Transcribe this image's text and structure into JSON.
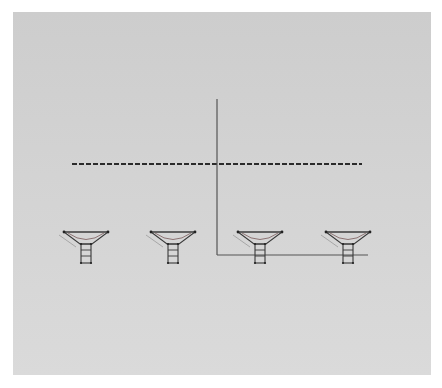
{
  "diagram": {
    "type": "interferometer-array",
    "background": {
      "panel_color": "#d2d2d2",
      "page_color": "#ffffff"
    },
    "wavefront": {
      "style": "dashed",
      "color": "#2a2a2a",
      "y": 164,
      "x_start": 72,
      "x_end": 362
    },
    "axes": {
      "color": "#555555",
      "origin": {
        "x": 217,
        "y": 255
      },
      "vertical_top_y": 99,
      "horizontal_end_x": 368
    },
    "antennas": [
      {
        "id": "antenna-1",
        "center_x": 86
      },
      {
        "id": "antenna-2",
        "center_x": 173
      },
      {
        "id": "antenna-3",
        "center_x": 260
      },
      {
        "id": "antenna-4",
        "center_x": 348
      }
    ],
    "antenna_style": {
      "rim_y": 232,
      "dish_half_width": 22,
      "dish_bottom_y": 244,
      "mount_top_y": 244,
      "mount_bottom_y": 263,
      "mount_half_width": 5,
      "line_color": "#3a3a3a",
      "accent_color": "#7a5a5a"
    }
  }
}
